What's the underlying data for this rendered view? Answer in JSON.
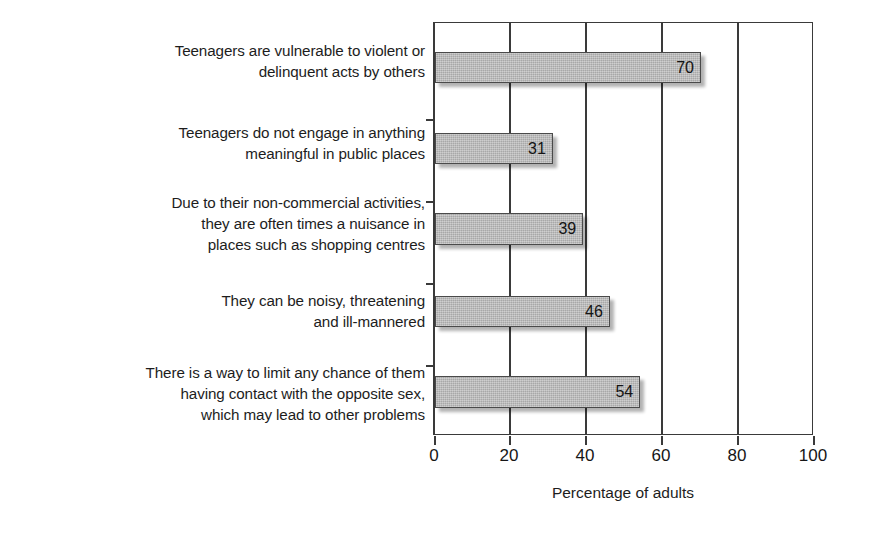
{
  "chart_data": {
    "type": "bar",
    "orientation": "horizontal",
    "title": "",
    "subtitle": "",
    "xlabel": "Percentage of adults",
    "ylabel": "",
    "xlim": [
      0,
      100
    ],
    "xticks": [
      0,
      20,
      40,
      60,
      80,
      100
    ],
    "xticklabels": [
      "0",
      "20",
      "40",
      "60",
      "80",
      "100"
    ],
    "grid": "vertical gridlines at 20, 40, 60, 80",
    "legend": "none",
    "bar_color": "#b3b3b3",
    "bar_edge_color": "#4a4a4a",
    "categories": [
      "Teenagers are vulnerable to violent or\ndelinquent acts by others",
      "Teenagers do not engage in anything\nmeaningful in public places",
      "Due to their non-commercial activities,\nthey are often times a nuisance in\nplaces such as shopping centres",
      "They can be noisy, threatening\nand ill-mannered",
      "There is a way to limit any chance of them\nhaving contact with the opposite sex,\nwhich may lead to other problems"
    ],
    "values": [
      70,
      31,
      39,
      46,
      54
    ],
    "value_labels": [
      "70",
      "31",
      "39",
      "46",
      "54"
    ]
  },
  "layout": {
    "bar_tops": [
      29,
      110,
      190,
      273,
      353
    ],
    "bar_heights": [
      31,
      31,
      32,
      31,
      32
    ],
    "label_tops": [
      18,
      100,
      170,
      268,
      340
    ],
    "ytick_tops": [
      96,
      178,
      260,
      342
    ]
  }
}
